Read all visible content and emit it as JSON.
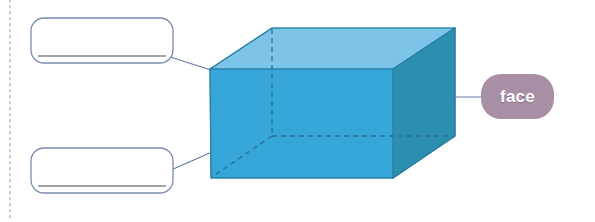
{
  "page": {
    "width": 595,
    "height": 222,
    "background": "#ffffff"
  },
  "divider": {
    "name": "left-dotted-divider",
    "orientation": "vertical",
    "x": 10,
    "color": "#c8c8c8",
    "style": "dotted"
  },
  "shape": {
    "name": "cuboid",
    "type": "rectangular-prism",
    "colors": {
      "top_face": "#7cc3e8",
      "front_face": "#36a6d8",
      "right_face": "#2d8fb0",
      "edge_stroke": "#2b7fa0",
      "hidden_edge": "#2b6f93"
    },
    "vertices": {
      "front_top_left": [
        210,
        69
      ],
      "front_top_right": [
        393,
        69
      ],
      "front_bottom_left": [
        211,
        178
      ],
      "front_bottom_right": [
        393,
        178
      ],
      "back_top_left": [
        272,
        28
      ],
      "back_top_right": [
        455,
        28
      ],
      "back_bottom_right": [
        455,
        136
      ],
      "back_bottom_left": [
        272,
        136
      ]
    },
    "hidden_edges": [
      "back_top_left-to-back_bottom_left",
      "back_bottom_left-to-back_bottom_right",
      "back_bottom_left-to-front_bottom_left"
    ]
  },
  "labels": [
    {
      "id": "face",
      "name": "face-label",
      "text": "face",
      "kind": "given",
      "fill": "#a98fa6",
      "text_color": "#ffffff"
    },
    {
      "id": "answer_top",
      "name": "answer-box-top",
      "text": "",
      "kind": "blank",
      "fill": "#ffffff",
      "border_color": "#7b8bb0",
      "writing_line_color": "#4a4a4a"
    },
    {
      "id": "answer_bottom",
      "name": "answer-box-bottom",
      "text": "",
      "kind": "blank",
      "fill": "#ffffff",
      "border_color": "#7b8bb0",
      "writing_line_color": "#4a4a4a"
    }
  ],
  "leader_lines": [
    {
      "name": "leader-line-top",
      "from": "answer_top",
      "to": "front_top_left_vertex",
      "color": "#6a7aa3"
    },
    {
      "name": "leader-line-bottom",
      "from": "answer_bottom",
      "to": "front_left_edge",
      "color": "#6a7aa3"
    },
    {
      "name": "leader-line-face",
      "from": "right_face",
      "to": "face",
      "color": "#6a7aa3"
    }
  ]
}
